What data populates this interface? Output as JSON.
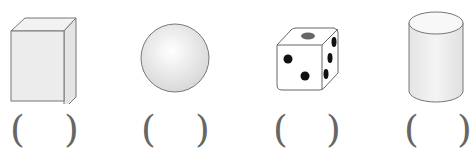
{
  "figures": [
    {
      "name": "cuboid",
      "paren_open": "(",
      "paren_close": ")"
    },
    {
      "name": "sphere",
      "paren_open": "(",
      "paren_close": ")"
    },
    {
      "name": "dice",
      "paren_open": "(",
      "paren_close": ")"
    },
    {
      "name": "cylinder",
      "paren_open": "(",
      "paren_close": ")"
    }
  ],
  "colors": {
    "outline": "#777777",
    "fill": "#ececec",
    "pip": "#111111",
    "top_pip": "#666666"
  }
}
